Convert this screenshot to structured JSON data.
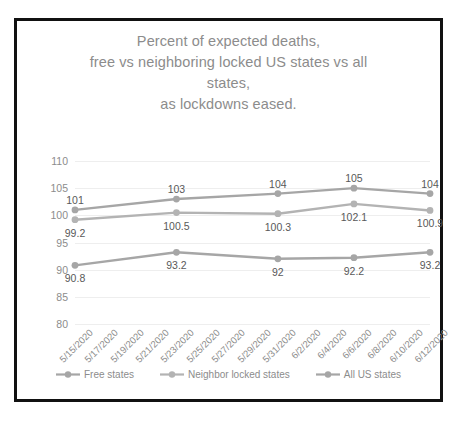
{
  "chart_data": {
    "type": "line",
    "title": "Percent of expected deaths, free vs neighboring locked US states vs all states, as lockdowns eased.",
    "title_lines": [
      "Percent of expected deaths,",
      "free vs neighboring locked US states vs all",
      "states,",
      "as lockdowns eased."
    ],
    "xlabel": "",
    "ylabel": "",
    "ylim": [
      80,
      110
    ],
    "ytick_labels": [
      "110",
      "105",
      "100",
      "95",
      "90",
      "85",
      "80"
    ],
    "ytick_values": [
      110,
      105,
      100,
      95,
      90,
      85,
      80
    ],
    "grid": true,
    "legend_position": "bottom",
    "categories": [
      "5/15/2020",
      "5/17/2020",
      "5/19/2020",
      "5/21/2020",
      "5/23/2020",
      "5/25/2020",
      "5/27/2020",
      "5/29/2020",
      "5/31/2020",
      "6/2/2020",
      "6/4/2020",
      "6/6/2020",
      "6/8/2020",
      "6/10/2020",
      "6/12/2020"
    ],
    "labeled_categories": [
      "5/15/2020",
      "5/23/2020",
      "5/31/2020",
      "6/6/2020",
      "6/12/2020"
    ],
    "series": [
      {
        "name": "Free states",
        "color": "#a6a6a6",
        "x": [
          "5/15/2020",
          "5/23/2020",
          "5/31/2020",
          "6/6/2020",
          "6/12/2020"
        ],
        "values": [
          90.8,
          93.2,
          92,
          92.2,
          93.2
        ],
        "labels": [
          "90.8",
          "93.2",
          "92",
          "92.2",
          "93.2"
        ]
      },
      {
        "name": "Neighbor locked states",
        "color": "#b3b3b3",
        "x": [
          "5/15/2020",
          "5/23/2020",
          "5/31/2020",
          "6/6/2020",
          "6/12/2020"
        ],
        "values": [
          99.2,
          100.5,
          100.3,
          102.1,
          100.9
        ],
        "labels": [
          "99.2",
          "100.5",
          "100.3",
          "102.1",
          "100.9"
        ]
      },
      {
        "name": "All US states",
        "color": "#a6a6a6",
        "x": [
          "5/15/2020",
          "5/23/2020",
          "5/31/2020",
          "6/6/2020",
          "6/12/2020"
        ],
        "values": [
          101,
          103,
          104,
          105,
          104
        ],
        "labels": [
          "101",
          "103",
          "104",
          "105",
          "104"
        ]
      }
    ]
  },
  "colors": {
    "frame": "#111111",
    "title_text": "#8c8c8c",
    "axis_text": "#8c8c8c",
    "data_label_text": "#595959",
    "gridline": "#eeeeee",
    "series_gray": "#a6a6a6",
    "background": "#ffffff"
  }
}
